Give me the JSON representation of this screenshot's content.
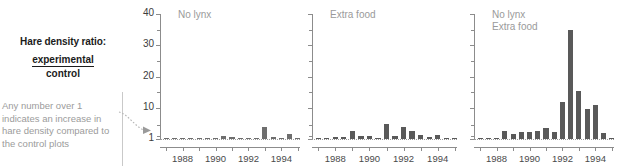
{
  "caption": {
    "title": "Hare density ratio:",
    "numerator": "experimental",
    "denominator": "control",
    "note": "Any number over 1 indicates an increase in hare density compared to the control plots"
  },
  "colors": {
    "bar": "#6e6e6e",
    "bar_dark": "#595959",
    "axis": "#8c8c8c",
    "panel_title": "#9a9a9a",
    "caption_text": "#1b1b1b",
    "note_text": "#9b9b9b",
    "baseline": "#9a9a9a"
  },
  "chart_data": {
    "type": "bar",
    "xlabel": "",
    "ylabel": "",
    "ylim": [
      1,
      40
    ],
    "yscale": "log-like",
    "grid": false,
    "legend": "none",
    "ytick_labels": [
      "40",
      "30",
      "20",
      "10",
      "1"
    ],
    "ytick_values": [
      40,
      30,
      20,
      10,
      1
    ],
    "yminor_values": [
      35,
      25,
      15,
      5,
      2
    ],
    "xtick_labels": [
      "1988",
      "1990",
      "1992",
      "1994"
    ],
    "xtick_values": [
      1988,
      1990,
      1992,
      1994
    ],
    "x": [
      1987.0,
      1987.5,
      1988.0,
      1988.5,
      1989.0,
      1989.5,
      1990.0,
      1990.5,
      1991.0,
      1991.5,
      1992.0,
      1992.5,
      1993.0,
      1993.5,
      1994.0,
      1994.5,
      1995.0
    ],
    "panels": [
      {
        "name": "no-lynx",
        "label": "No lynx",
        "values": [
          1.0,
          1.05,
          1.1,
          1.3,
          1.1,
          1.0,
          1.05,
          1.9,
          1.5,
          1.2,
          1.1,
          1.15,
          4.5,
          1.6,
          1.1,
          2.4,
          1.1
        ]
      },
      {
        "name": "extra-food",
        "label": "Extra food",
        "values": [
          1.0,
          1.1,
          1.5,
          1.7,
          3.2,
          2.0,
          1.9,
          1.3,
          5.4,
          1.8,
          4.6,
          3.2,
          2.2,
          1.7,
          2.1,
          1.2,
          1.0
        ]
      },
      {
        "name": "no-lynx-extra-food",
        "label": "No lynx\nExtra food",
        "values": [
          1.0,
          1.0,
          1.4,
          3.4,
          2.3,
          3.0,
          3.1,
          3.4,
          4.1,
          3.0,
          12.0,
          35.0,
          15.5,
          9.5,
          10.8,
          2.7,
          1.0
        ]
      }
    ]
  }
}
